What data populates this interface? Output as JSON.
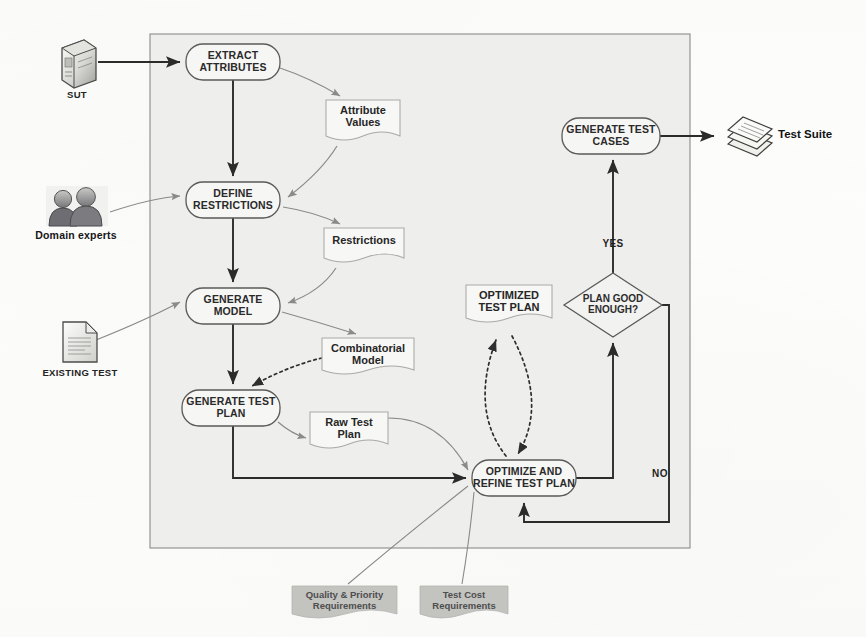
{
  "diagram": {
    "container": {
      "name": "process-boundary",
      "x": 150,
      "y": 34,
      "w": 540,
      "h": 514
    },
    "colors": {
      "container_fill": "#eeeeec",
      "container_stroke": "#8b8b88",
      "process_stroke": "#5a5a58",
      "process_fill": "#f6f6f4",
      "artifact_stroke": "#a9a9a5",
      "artifact_fill": "#f7f7f5",
      "flow_arrow": "#303030",
      "soft_arrow": "#8a8a86",
      "dotted_arrow": "#2e2e2e",
      "requirements_fill": "#c3c3c0",
      "text": "#1b1b1b"
    },
    "processes": [
      {
        "id": "extract-attributes",
        "label": "EXTRACT\nATTRIBUTES",
        "x": 186,
        "y": 44,
        "w": 94,
        "h": 36
      },
      {
        "id": "define-restrictions",
        "label": "DEFINE\nRESTRICTIONS",
        "x": 186,
        "y": 182,
        "w": 94,
        "h": 36
      },
      {
        "id": "generate-model",
        "label": "GENERATE\nMODEL",
        "x": 186,
        "y": 288,
        "w": 94,
        "h": 36
      },
      {
        "id": "generate-test-plan",
        "label": "GENERATE TEST\nPLAN",
        "x": 182,
        "y": 390,
        "w": 98,
        "h": 36
      },
      {
        "id": "optimize-refine",
        "label": "OPTIMIZE AND\nREFINE TEST PLAN",
        "x": 472,
        "y": 460,
        "w": 104,
        "h": 36
      },
      {
        "id": "generate-test-cases",
        "label": "GENERATE TEST\nCASES",
        "x": 562,
        "y": 118,
        "w": 98,
        "h": 36
      }
    ],
    "decision": {
      "id": "plan-good-enough",
      "label": "PLAN GOOD\nENOUGH?",
      "cx": 613,
      "cy": 305,
      "rx": 49,
      "ry": 32
    },
    "artifacts": [
      {
        "id": "attribute-values",
        "label": "Attribute\nValues",
        "x": 326,
        "y": 100,
        "w": 74,
        "h": 42
      },
      {
        "id": "restrictions",
        "label": "Restrictions",
        "x": 324,
        "y": 228,
        "w": 80,
        "h": 36
      },
      {
        "id": "combinatorial-model",
        "label": "Combinatorial\nModel",
        "x": 322,
        "y": 338,
        "w": 92,
        "h": 42
      },
      {
        "id": "raw-test-plan",
        "label": "Raw Test\nPlan",
        "x": 310,
        "y": 412,
        "w": 78,
        "h": 42
      },
      {
        "id": "optimized-test-plan",
        "label": "OPTIMIZED\nTEST PLAN",
        "x": 466,
        "y": 285,
        "w": 86,
        "h": 42
      }
    ],
    "requirements": [
      {
        "id": "quality-priority-requirements",
        "label": "Quality & Priority\nRequirements",
        "x": 292,
        "y": 586,
        "w": 105,
        "h": 34
      },
      {
        "id": "test-cost-requirements",
        "label": "Test Cost\nRequirements",
        "x": 420,
        "y": 586,
        "w": 88,
        "h": 34
      }
    ],
    "external": [
      {
        "id": "sut",
        "label": "SUT",
        "icon": "server-box-icon",
        "x": 60,
        "y": 42,
        "label_x": 57,
        "label_y": 88
      },
      {
        "id": "domain-experts",
        "label": "Domain experts",
        "icon": "two-users-icon",
        "x": 44,
        "y": 186,
        "label_x": 29,
        "label_y": 222
      },
      {
        "id": "existing-test",
        "label": "EXISTING TEST",
        "icon": "document-icon",
        "x": 62,
        "y": 320,
        "label_x": 27,
        "label_y": 370
      },
      {
        "id": "test-suite",
        "label": "Test Suite",
        "icon": "document-stack-icon",
        "x": 716,
        "y": 118,
        "label_x": 775,
        "label_y": 131
      }
    ],
    "edge_labels": [
      {
        "id": "yes-branch-label",
        "label": "YES",
        "x": 604,
        "y": 243
      },
      {
        "id": "no-branch-label",
        "label": "NO",
        "x": 659,
        "y": 474
      }
    ]
  }
}
